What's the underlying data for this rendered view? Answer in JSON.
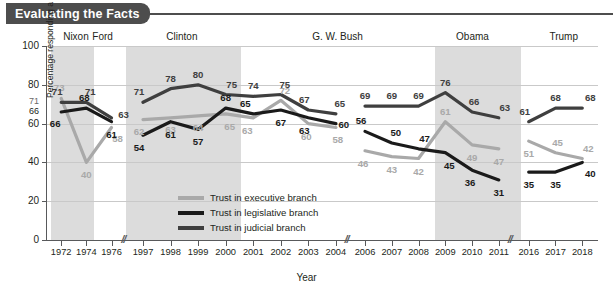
{
  "banner": {
    "title": "Evaluating the Facts"
  },
  "axis": {
    "y_title": "Percentage responding a great deal/fair amount",
    "x_title": "Year",
    "y_ticks": [
      "0",
      "20",
      "40",
      "60",
      "80",
      "100"
    ],
    "extra_y_marks": [
      "71",
      "66"
    ]
  },
  "eras": [
    {
      "name": "Nixon",
      "label": "Nixon"
    },
    {
      "name": "Ford",
      "label": "Ford"
    },
    {
      "name": "Clinton",
      "label": "Clinton"
    },
    {
      "name": "G. W. Bush",
      "label": "G. W. Bush"
    },
    {
      "name": "Obama",
      "label": "Obama"
    },
    {
      "name": "Trump",
      "label": "Trump"
    }
  ],
  "legend": {
    "position": "inside-bottom-center",
    "items": [
      {
        "label": "Trust in executive branch",
        "color": "#a9a9a9"
      },
      {
        "label": "Trust in legislative branch",
        "color": "#1a1a1a"
      },
      {
        "label": "Trust in judicial branch",
        "color": "#3f3f3f"
      }
    ]
  },
  "chart_data": {
    "type": "line",
    "title": "Evaluating the Facts",
    "xlabel": "Year",
    "ylabel": "Percentage responding a great deal/fair amount",
    "ylim": [
      0,
      100
    ],
    "grid": true,
    "axis_breaks": [
      "1976-1997",
      "2004-2006",
      "2011-2016"
    ],
    "categories": [
      "1972",
      "1974",
      "1976",
      "1997",
      "1998",
      "1999",
      "2000",
      "2001",
      "2002",
      "2003",
      "2004",
      "2006",
      "2007",
      "2008",
      "2009",
      "2010",
      "2011",
      "2016",
      "2017",
      "2018"
    ],
    "series": [
      {
        "name": "Trust in executive branch",
        "color": "#a9a9a9",
        "values": [
          73,
          40,
          58,
          62,
          63,
          64,
          65,
          63,
          72,
          60,
          58,
          46,
          43,
          42,
          61,
          49,
          47,
          51,
          45,
          42
        ]
      },
      {
        "name": "Trust in legislative branch",
        "color": "#1a1a1a",
        "values": [
          66,
          68,
          61,
          54,
          61,
          57,
          68,
          65,
          67,
          63,
          60,
          56,
          50,
          47,
          45,
          36,
          31,
          35,
          35,
          40
        ]
      },
      {
        "name": "Trust in judicial branch",
        "color": "#3f3f3f",
        "values": [
          71,
          71,
          63,
          71,
          78,
          80,
          75,
          74,
          75,
          67,
          65,
          69,
          69,
          69,
          76,
          66,
          63,
          61,
          68,
          68
        ]
      }
    ]
  }
}
